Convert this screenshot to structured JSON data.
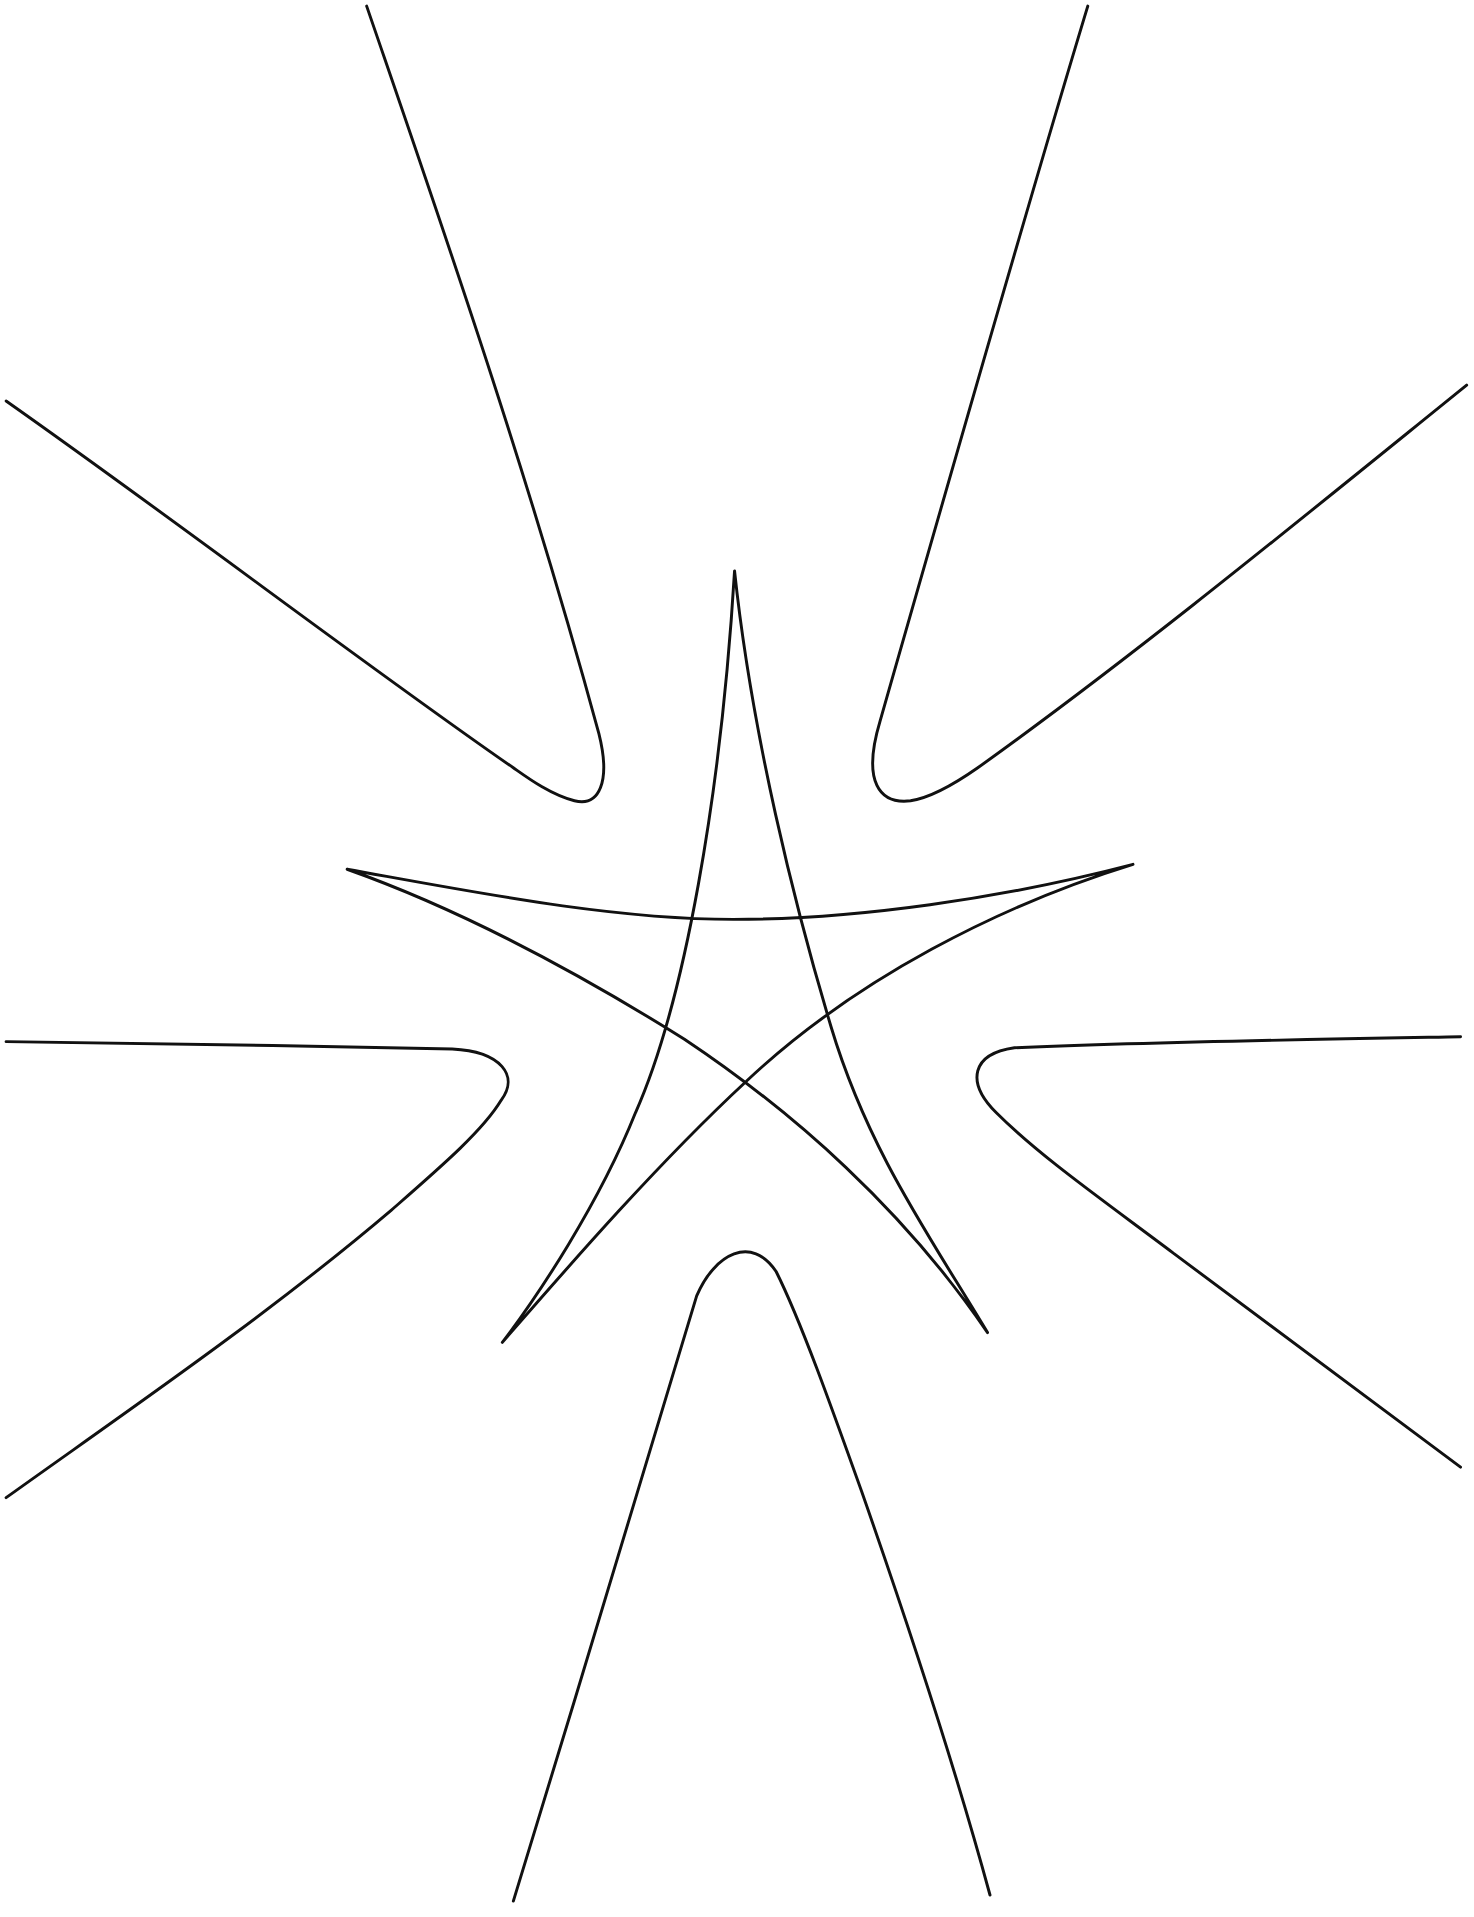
{
  "drawing": {
    "title": "Star with surrounding curved arms line drawing",
    "background": "#ffffff",
    "stroke_color": "#111111",
    "elements": [
      {
        "name": "central-star",
        "description": "Five-pointed star drawn with concave curved edges"
      },
      {
        "name": "arm-top",
        "description": "Upper V-shaped curve between top-left and top-right"
      },
      {
        "name": "arm-upper-left",
        "description": "Upper-left V curve"
      },
      {
        "name": "arm-upper-right",
        "description": "Upper-right V curve"
      },
      {
        "name": "arm-lower-left",
        "description": "Left-side V curve"
      },
      {
        "name": "arm-lower-right",
        "description": "Right-side V curve"
      },
      {
        "name": "arm-bottom",
        "description": "Bottom inverted-U curve"
      }
    ]
  }
}
